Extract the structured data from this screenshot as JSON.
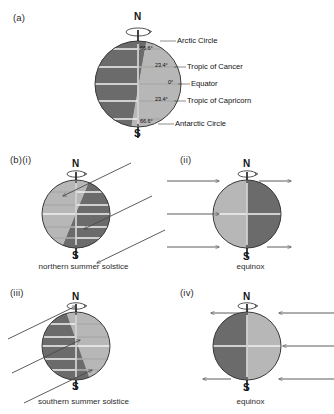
{
  "figure": {
    "panel_a": {
      "label": "(a)",
      "north_pole": "N",
      "south_pole": "S",
      "latitudes": [
        {
          "name": "Arctic Circle",
          "angle": "66.6°"
        },
        {
          "name": "Tropic of Cancer",
          "angle": "23.4°"
        },
        {
          "name": "Equator",
          "angle": "0°"
        },
        {
          "name": "Tropic of Capricorn",
          "angle": "23.4°"
        },
        {
          "name": "Antarctic Circle",
          "angle": "66.6°"
        }
      ]
    },
    "panel_b": {
      "label": "(b)(i)",
      "sub_labels": [
        "(b)(i)",
        "(ii)",
        "(iii)",
        "(iv)"
      ],
      "items": [
        {
          "id": "i",
          "label": "(b)(i)",
          "caption": "northern summer solstice",
          "north_pole": "N",
          "south_pole": "S"
        },
        {
          "id": "ii",
          "label": "(ii)",
          "caption": "equinox",
          "north_pole": "N",
          "south_pole": "S"
        },
        {
          "id": "iii",
          "label": "(iii)",
          "caption": "southern summer solstice",
          "north_pole": "N",
          "south_pole": "S"
        },
        {
          "id": "iv",
          "label": "(iv)",
          "caption": "equinox",
          "north_pole": "N",
          "south_pole": "S"
        }
      ]
    },
    "colors": {
      "lit": "#b7b7b7",
      "dark": "#6b6b6b",
      "outline": "#3a3a3a",
      "ray": "#4a4a4a",
      "background": "#ffffff"
    }
  }
}
